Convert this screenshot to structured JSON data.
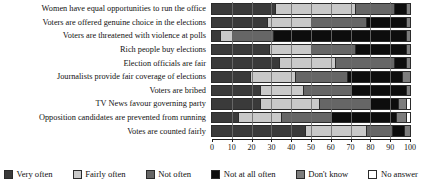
{
  "chart_data": {
    "type": "bar",
    "orientation": "horizontal",
    "stacked": true,
    "normalized_percent": true,
    "title": "",
    "subtitle": "",
    "xlabel": "",
    "ylabel": "",
    "xlim": [
      0,
      100
    ],
    "xticks": [
      "0",
      "10",
      "20",
      "30",
      "40",
      "50",
      "60",
      "70",
      "80",
      "90",
      "100"
    ],
    "grid": true,
    "legend_position": "bottom",
    "categories": [
      "Women have equal opportunities to run the office",
      "Voters are offered genuine choice in the elections",
      "Voters are threatened with violence at polls",
      "Rich people buy elections",
      "Election officials are fair",
      "Journalists provide fair coverage of elections",
      "Voters are bribed",
      "TV News favour governing party",
      "Opposition candidates are prevented from running",
      "Votes are counted fairly"
    ],
    "series": [
      {
        "name": "Very often",
        "color": "#3a3a3a",
        "values": [
          32,
          28,
          4,
          29,
          34,
          19,
          24,
          24,
          13,
          47
        ]
      },
      {
        "name": "Fairly often",
        "color": "#c9c9c9",
        "values": [
          40,
          22,
          6,
          21,
          28,
          23,
          22,
          30,
          22,
          31
        ]
      },
      {
        "name": "Not often",
        "color": "#666666",
        "values": [
          20,
          28,
          21,
          22,
          30,
          26,
          24,
          26,
          25,
          13
        ]
      },
      {
        "name": "Not at all often",
        "color": "#0d0d0d",
        "values": [
          6,
          20,
          67,
          26,
          6,
          28,
          28,
          14,
          33,
          6
        ]
      },
      {
        "name": "Don't know",
        "color": "#7d7d7d",
        "values": [
          2,
          2,
          2,
          2,
          2,
          4,
          2,
          4,
          5,
          3
        ]
      },
      {
        "name": "No answer",
        "color": "#ffffff",
        "values": [
          0,
          0,
          0,
          0,
          0,
          0,
          0,
          2,
          2,
          0
        ]
      }
    ]
  },
  "legend": {
    "items": [
      {
        "label": "Very often",
        "color": "#3a3a3a"
      },
      {
        "label": "Fairly often",
        "color": "#c9c9c9"
      },
      {
        "label": "Not often",
        "color": "#666666"
      },
      {
        "label": "Not at all often",
        "color": "#0d0d0d"
      },
      {
        "label": "Don't know",
        "color": "#7d7d7d"
      },
      {
        "label": "No answer",
        "color": "#ffffff"
      }
    ]
  }
}
